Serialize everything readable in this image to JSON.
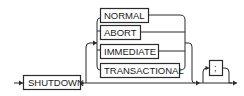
{
  "diagram": {
    "type": "railroad-syntax",
    "statement": "SHUTDOWN",
    "keyword": "SHUTDOWN",
    "options": [
      {
        "label": "NORMAL"
      },
      {
        "label": "ABORT"
      },
      {
        "label": "IMMEDIATE"
      },
      {
        "label": "TRANSACTIONAL"
      }
    ],
    "options_optional": true,
    "terminator": {
      "label": ";",
      "optional": true
    },
    "colors": {
      "stroke": "#2b2b2b",
      "background": "#ffffff",
      "text": "#1a1a1a"
    }
  }
}
